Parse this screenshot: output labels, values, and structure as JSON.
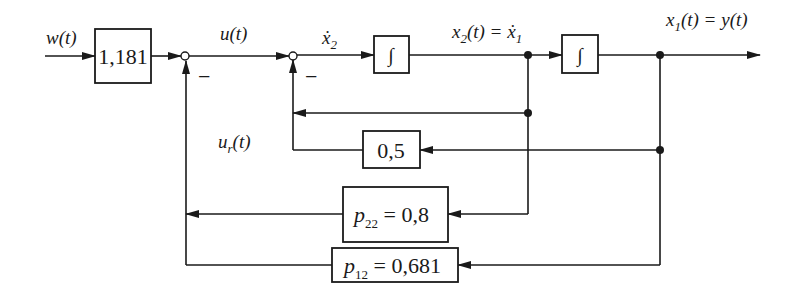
{
  "diagram": {
    "type": "block-diagram",
    "signals": {
      "input": "w(t)",
      "control": "u(t)",
      "x2_dot": "ẋ",
      "x2_dot_sub": "2",
      "x2": "x",
      "x2_sub": "2",
      "x2_rest": "(t) = ẋ",
      "x2_rest_sub": "1",
      "x1": "x",
      "x1_sub": "1",
      "x1_rest": "(t) = y(t)",
      "feedback": "u",
      "feedback_sub": "r",
      "feedback_rest": "(t)"
    },
    "blocks": {
      "prefilter": "1,181",
      "integrator1": "∫",
      "integrator2": "∫",
      "gain_inner": "0,5",
      "p22_label": "p",
      "p22_sub": "22",
      "p22_value": " = 0,8",
      "p12_label": "p",
      "p12_sub": "12",
      "p12_value": " = 0,681"
    },
    "summing_signs": {
      "junction1": "−",
      "junction2": "−"
    }
  }
}
